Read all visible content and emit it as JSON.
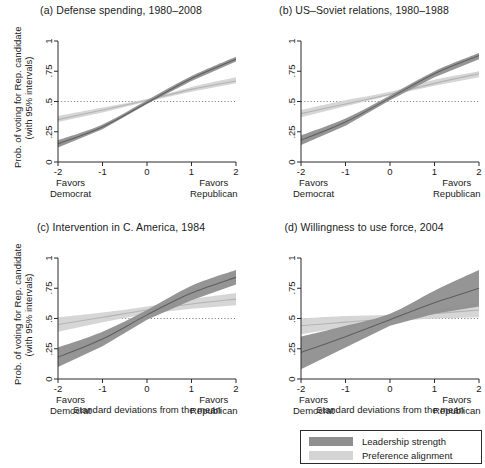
{
  "figure": {
    "y_axis_caption_line1": "Prob. of voting for Rep. candidate",
    "y_axis_caption_line2": "(with 95% intervals)",
    "x_axis_caption": "Standard deviations from the mean",
    "x_left_sub_line1": "Favors",
    "x_left_sub_line2": "Democrat",
    "x_right_sub_line1": "Favors",
    "x_right_sub_line2": "Republican",
    "y_ticks": [
      "0",
      ".25",
      ".5",
      ".75",
      "1"
    ],
    "x_ticks": [
      "-2",
      "-1",
      "0",
      "1",
      "2"
    ],
    "reference_line_value": 0.5
  },
  "legend": {
    "items": [
      {
        "label": "Leadership strength",
        "color": "#8a8a8a"
      },
      {
        "label": "Preference alignment",
        "color": "#d2d2d2"
      }
    ]
  },
  "colors": {
    "leadership_band": "#8f8f8f",
    "leadership_line": "#5f5f5f",
    "preference_band": "#d4d4d4",
    "preference_line": "#b4b4b4",
    "axis": "#2b2b2b",
    "reference_dotted": "#6f6f6f"
  },
  "chart_data": {
    "type": "line",
    "xlabel": "Standard deviations from the mean",
    "ylabel": "Prob. of voting for Rep. candidate (with 95% intervals)",
    "xlim": [
      -2,
      2
    ],
    "ylim": [
      0,
      1
    ],
    "grid": false,
    "legend_position": "bottom-right",
    "reference_line": {
      "y": 0.5,
      "style": "dotted"
    },
    "panels": [
      {
        "id": "a",
        "title": "(a) Defense spending, 1980–2008",
        "x": [
          -2,
          -1,
          0,
          1,
          2
        ],
        "series": [
          {
            "name": "Leadership strength",
            "values": [
              0.15,
              0.29,
              0.49,
              0.69,
              0.85
            ],
            "ci_lower": [
              0.12,
              0.27,
              0.48,
              0.67,
              0.83
            ],
            "ci_upper": [
              0.18,
              0.31,
              0.51,
              0.71,
              0.87
            ]
          },
          {
            "name": "Preference alignment",
            "values": [
              0.35,
              0.43,
              0.51,
              0.6,
              0.67
            ],
            "ci_lower": [
              0.33,
              0.41,
              0.5,
              0.58,
              0.65
            ],
            "ci_upper": [
              0.38,
              0.45,
              0.52,
              0.62,
              0.7
            ]
          }
        ]
      },
      {
        "id": "b",
        "title": "(b) US–Soviet relations, 1980–1988",
        "x": [
          -2,
          -1,
          0,
          1,
          2
        ],
        "series": [
          {
            "name": "Leadership strength",
            "values": [
              0.18,
              0.33,
              0.53,
              0.73,
              0.88
            ],
            "ci_lower": [
              0.14,
              0.3,
              0.51,
              0.7,
              0.85
            ],
            "ci_upper": [
              0.22,
              0.36,
              0.55,
              0.75,
              0.9
            ]
          },
          {
            "name": "Preference alignment",
            "values": [
              0.4,
              0.48,
              0.56,
              0.65,
              0.73
            ],
            "ci_lower": [
              0.37,
              0.46,
              0.55,
              0.63,
              0.7
            ],
            "ci_upper": [
              0.43,
              0.51,
              0.58,
              0.68,
              0.75
            ]
          }
        ]
      },
      {
        "id": "c",
        "title": "(c) Intervention in C. America, 1984",
        "x": [
          -2,
          -1,
          0,
          1,
          2
        ],
        "series": [
          {
            "name": "Leadership strength",
            "values": [
              0.18,
              0.33,
              0.53,
              0.71,
              0.84
            ],
            "ci_lower": [
              0.1,
              0.27,
              0.49,
              0.65,
              0.78
            ],
            "ci_upper": [
              0.26,
              0.39,
              0.57,
              0.77,
              0.9
            ]
          },
          {
            "name": "Preference alignment",
            "values": [
              0.45,
              0.51,
              0.57,
              0.62,
              0.66
            ],
            "ci_lower": [
              0.39,
              0.47,
              0.54,
              0.58,
              0.61
            ],
            "ci_upper": [
              0.51,
              0.55,
              0.6,
              0.66,
              0.71
            ]
          }
        ]
      },
      {
        "id": "d",
        "title": "(d) Willingness to use force, 2004",
        "x": [
          -2,
          -1,
          0,
          1,
          2
        ],
        "series": [
          {
            "name": "Leadership strength",
            "values": [
              0.22,
              0.35,
              0.49,
              0.63,
              0.75
            ],
            "ci_lower": [
              0.08,
              0.26,
              0.44,
              0.54,
              0.6
            ],
            "ci_upper": [
              0.35,
              0.44,
              0.54,
              0.73,
              0.9
            ]
          },
          {
            "name": "Preference alignment",
            "values": [
              0.44,
              0.47,
              0.5,
              0.54,
              0.57
            ],
            "ci_lower": [
              0.37,
              0.43,
              0.48,
              0.5,
              0.51
            ],
            "ci_upper": [
              0.5,
              0.52,
              0.53,
              0.58,
              0.63
            ]
          }
        ]
      }
    ]
  }
}
